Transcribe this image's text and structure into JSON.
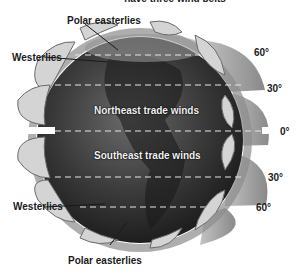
{
  "figure": {
    "title_partial": "have three wind belts",
    "labels": {
      "polar_easterlies_north": "Polar easterlies",
      "westerlies_north": "Westerlies",
      "northeast_trade_winds": "Northeast trade winds",
      "southeast_trade_winds": "Southeast trade winds",
      "westerlies_south": "Westerlies",
      "polar_easterlies_south": "Polar easterlies"
    },
    "latitudes": {
      "n60": "60°",
      "n30": "30°",
      "equator": "0°",
      "s30": "30°",
      "s60": "60°"
    },
    "colors": {
      "globe_dark": "#2b2b2b",
      "globe_mid": "#555555",
      "cell_light": "#cfcfcf",
      "band_gray": "#9a9a9a",
      "dash": "#e6e6e6"
    }
  }
}
